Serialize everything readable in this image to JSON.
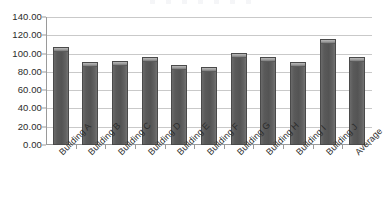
{
  "chart_data": {
    "type": "bar",
    "title": "",
    "xlabel": "",
    "ylabel": "",
    "ylim": [
      0,
      140
    ],
    "ytick_step": 20,
    "grid": true,
    "legend": false,
    "xtick_rotation": -45,
    "categories": [
      "Building A",
      "Building B",
      "Building C",
      "Building D",
      "Building E",
      "Building F",
      "Building G",
      "Building H",
      "Building I",
      "Building J",
      "Average"
    ],
    "values": [
      107.0,
      91.0,
      91.5,
      96.5,
      87.0,
      85.0,
      100.5,
      96.5,
      91.0,
      116.0,
      96.5
    ],
    "ytick_labels": [
      "140.00",
      "120.00",
      "100.00",
      "80.00",
      "60.00",
      "40.00",
      "20.00",
      "0.00"
    ],
    "ytick_values": [
      140,
      120,
      100,
      80,
      60,
      40,
      20,
      0
    ]
  },
  "style": {
    "bar_color": "#585858",
    "bar_cap_color": "#a2a2a2",
    "bar_border_color": "#4a4a4a",
    "gridline_color": "#c9c9c9",
    "axis_color": "#9a9a9a",
    "background": "#ffffff",
    "text_color": "#2b2b2b"
  }
}
